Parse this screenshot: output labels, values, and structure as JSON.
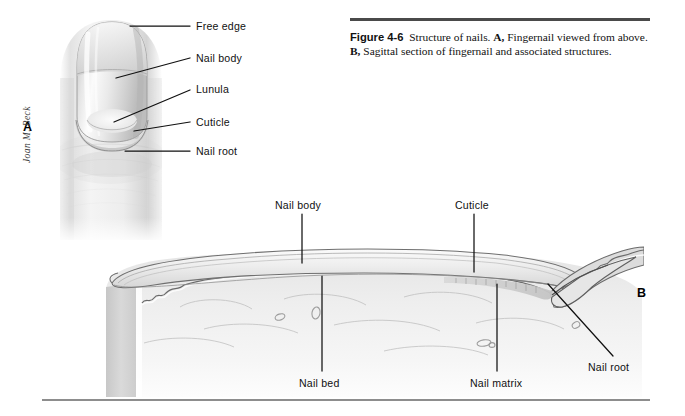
{
  "figure": {
    "caption_label": "Figure 4-6",
    "caption_body": "Structure of nails.",
    "caption_part_a_letter": "A,",
    "caption_part_a_text": "Fingernail viewed from above.",
    "caption_part_b_letter": "B,",
    "caption_part_b_text": "Sagittal section of fingernail and associated structures.",
    "artist_signature": "Joan M. Beck"
  },
  "panels": {
    "a": {
      "letter": "A",
      "title": "Fingernail viewed from above"
    },
    "b": {
      "letter": "B",
      "title": "Sagittal section of fingernail"
    }
  },
  "labels_panel_a": [
    {
      "id": "free-edge",
      "text": "Free edge"
    },
    {
      "id": "nail-body",
      "text": "Nail body"
    },
    {
      "id": "lunula",
      "text": "Lunula"
    },
    {
      "id": "cuticle",
      "text": "Cuticle"
    },
    {
      "id": "nail-root",
      "text": "Nail root"
    }
  ],
  "labels_panel_b": [
    {
      "id": "nail-body",
      "text": "Nail body"
    },
    {
      "id": "cuticle",
      "text": "Cuticle"
    },
    {
      "id": "nail-bed",
      "text": "Nail bed"
    },
    {
      "id": "nail-matrix",
      "text": "Nail matrix"
    },
    {
      "id": "nail-root",
      "text": "Nail root"
    }
  ],
  "colors": {
    "rule_top": "#4a4a4a",
    "rule_bottom": "#8d8d8d",
    "leader_line": "#111111",
    "ink": "#111111",
    "skin_light": "#f2f2f2",
    "skin_mid": "#dcdcdc",
    "skin_shadow": "#b9b9b9",
    "nail_plate": "#e9e9e9",
    "outline": "#5a5a5a",
    "page": "#ffffff"
  }
}
